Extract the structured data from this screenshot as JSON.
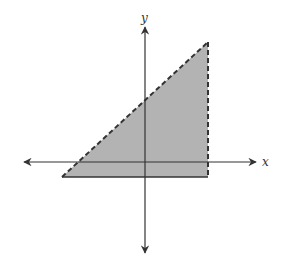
{
  "diagram": {
    "type": "coordinate-plane-shaded-region",
    "axes": {
      "x_label": "x",
      "y_label": "y",
      "origin_px": [
        145,
        162
      ],
      "x_axis": {
        "from_px": [
          22,
          162
        ],
        "to_px": [
          258,
          162
        ],
        "arrows": "both"
      },
      "y_axis": {
        "from_px": [
          145,
          25
        ],
        "to_px": [
          145,
          255
        ],
        "arrows": "both"
      }
    },
    "region": {
      "shape": "triangle",
      "fill_color": "#b3b3b3",
      "vertices_px": [
        [
          62,
          177
        ],
        [
          208,
          42
        ],
        [
          208,
          177
        ]
      ],
      "boundaries": [
        {
          "name": "diagonal",
          "style": "dashed",
          "from_px": [
            62,
            177
          ],
          "to_px": [
            208,
            42
          ]
        },
        {
          "name": "right-vertical",
          "style": "dashed",
          "from_px": [
            208,
            42
          ],
          "to_px": [
            208,
            177
          ]
        },
        {
          "name": "bottom-horizontal",
          "style": "solid",
          "from_px": [
            62,
            177
          ],
          "to_px": [
            208,
            177
          ]
        }
      ]
    },
    "colors": {
      "axis": "#333333",
      "boundary": "#333333",
      "fill": "#b3b3b3",
      "background": "#ffffff"
    }
  }
}
